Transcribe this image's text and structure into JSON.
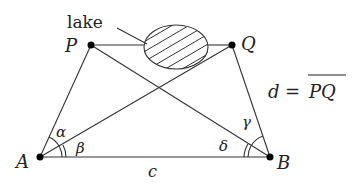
{
  "diagram": {
    "type": "surveying-geometry",
    "points": {
      "A": {
        "label": "A",
        "x": 40,
        "y": 157
      },
      "B": {
        "label": "B",
        "x": 270,
        "y": 157
      },
      "P": {
        "label": "P",
        "x": 91,
        "y": 45
      },
      "Q": {
        "label": "Q",
        "x": 232,
        "y": 45
      }
    },
    "lake": {
      "label": "lake",
      "cx": 176,
      "cy": 47,
      "rx": 32,
      "ry": 22,
      "fill": "hatched"
    },
    "angles": {
      "alpha": "α",
      "beta": "β",
      "gamma": "γ",
      "delta": "δ"
    },
    "baseline_label": "c",
    "formula": {
      "lhs": "d",
      "equals": "=",
      "rhs": "PQ"
    },
    "edges": [
      "A-P",
      "A-Q",
      "A-B",
      "B-P",
      "B-Q",
      "P-Q (through lake)"
    ],
    "colors": {
      "stroke": "#333333",
      "point": "#000000",
      "background": "#ffffff"
    }
  }
}
